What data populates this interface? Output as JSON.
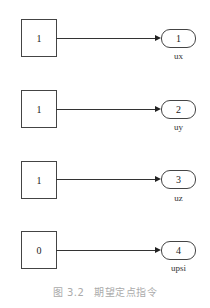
{
  "diagram": {
    "type": "simulink-block-diagram",
    "rows": [
      {
        "constant": "1",
        "outport_number": "1",
        "outport_label": "ux"
      },
      {
        "constant": "1",
        "outport_number": "2",
        "outport_label": "uy"
      },
      {
        "constant": "1",
        "outport_number": "3",
        "outport_label": "uz"
      },
      {
        "constant": "0",
        "outport_number": "4",
        "outport_label": "upsi"
      }
    ]
  },
  "caption": {
    "figure_number": "图 3.2",
    "title": "期望定点指令"
  }
}
